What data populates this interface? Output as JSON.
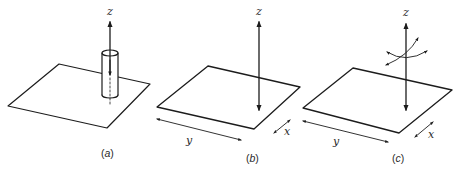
{
  "figure": {
    "panels": [
      {
        "id": "a",
        "caption_open": "(",
        "caption_letter": "a",
        "caption_close": ")",
        "axis_label_z": "z",
        "description": "Plate with cylinder along z axis (single-headed arrow up through cylinder)"
      },
      {
        "id": "b",
        "caption_open": "(",
        "caption_letter": "b",
        "caption_close": ")",
        "axis_label_z": "z",
        "axis_label_x": "x",
        "axis_label_y": "y",
        "description": "Plate with double-headed arrow along z, in-plane translation arrows along x and y"
      },
      {
        "id": "c",
        "caption_open": "(",
        "caption_letter": "c",
        "caption_close": ")",
        "axis_label_z": "z",
        "axis_label_x": "x",
        "axis_label_y": "y",
        "description": "Plate with double-headed arrow along z plus rotation arcs, in-plane arrows along x and y"
      }
    ],
    "colors": {
      "ink": "#1c1c1c",
      "background": "#ffffff"
    }
  }
}
